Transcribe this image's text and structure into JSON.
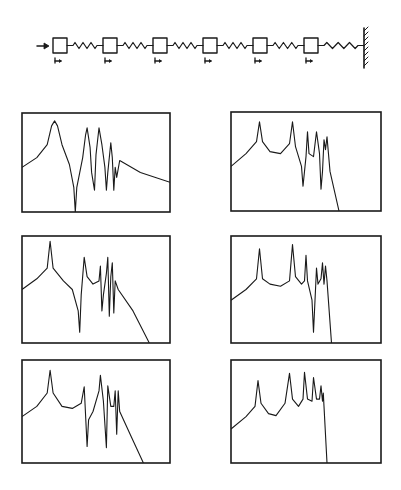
{
  "diagram": {
    "type": "mass-spring chain with frequency response plots",
    "colors": {
      "ink": "#1a1a1a",
      "background": "#ffffff"
    },
    "chain": {
      "input_arrow": {
        "x1": 37,
        "x2": 48,
        "y": 46,
        "icon": "force-arrow-icon"
      },
      "masses": [
        {
          "x": 53,
          "y": 38,
          "w": 14,
          "h": 15
        },
        {
          "x": 103,
          "y": 38,
          "w": 14,
          "h": 15
        },
        {
          "x": 153,
          "y": 38,
          "w": 14,
          "h": 15
        },
        {
          "x": 203,
          "y": 38,
          "w": 14,
          "h": 15
        },
        {
          "x": 253,
          "y": 38,
          "w": 14,
          "h": 15
        },
        {
          "x": 304,
          "y": 38,
          "w": 14,
          "h": 15
        }
      ],
      "springs_count": 6,
      "wall": {
        "x": 364,
        "y1": 28,
        "y2": 68,
        "icon": "fixed-wall-icon"
      },
      "displacement_markers_count": 6
    }
  },
  "chart_data": [
    {
      "type": "line",
      "id": "response-row1-left",
      "title": "",
      "xlabel": "",
      "ylabel": "",
      "grid": false,
      "frame": {
        "x": 22,
        "y": 113,
        "w": 148,
        "h": 99
      },
      "points": [
        [
          0,
          0.55
        ],
        [
          0.1,
          0.45
        ],
        [
          0.17,
          0.32
        ],
        [
          0.2,
          0.13
        ],
        [
          0.22,
          0.08
        ],
        [
          0.24,
          0.13
        ],
        [
          0.27,
          0.32
        ],
        [
          0.32,
          0.52
        ],
        [
          0.35,
          0.75
        ],
        [
          0.36,
          1.0
        ],
        [
          0.37,
          0.75
        ],
        [
          0.41,
          0.45
        ],
        [
          0.43,
          0.22
        ],
        [
          0.44,
          0.15
        ],
        [
          0.46,
          0.35
        ],
        [
          0.47,
          0.6
        ],
        [
          0.49,
          0.78
        ],
        [
          0.5,
          0.42
        ],
        [
          0.52,
          0.15
        ],
        [
          0.54,
          0.32
        ],
        [
          0.56,
          0.55
        ],
        [
          0.57,
          0.78
        ],
        [
          0.58,
          0.6
        ],
        [
          0.6,
          0.3
        ],
        [
          0.61,
          0.45
        ],
        [
          0.62,
          0.78
        ],
        [
          0.63,
          0.55
        ],
        [
          0.64,
          0.65
        ],
        [
          0.66,
          0.48
        ],
        [
          0.8,
          0.6
        ],
        [
          1.0,
          0.7
        ]
      ]
    },
    {
      "type": "line",
      "id": "response-row1-right",
      "title": "",
      "xlabel": "",
      "ylabel": "",
      "grid": false,
      "frame": {
        "x": 231,
        "y": 112,
        "w": 150,
        "h": 99
      },
      "points": [
        [
          0,
          0.55
        ],
        [
          0.1,
          0.42
        ],
        [
          0.17,
          0.3
        ],
        [
          0.19,
          0.1
        ],
        [
          0.21,
          0.3
        ],
        [
          0.26,
          0.4
        ],
        [
          0.33,
          0.42
        ],
        [
          0.39,
          0.32
        ],
        [
          0.41,
          0.1
        ],
        [
          0.43,
          0.35
        ],
        [
          0.47,
          0.55
        ],
        [
          0.48,
          0.75
        ],
        [
          0.5,
          0.45
        ],
        [
          0.51,
          0.2
        ],
        [
          0.52,
          0.42
        ],
        [
          0.55,
          0.45
        ],
        [
          0.57,
          0.2
        ],
        [
          0.59,
          0.42
        ],
        [
          0.6,
          0.78
        ],
        [
          0.61,
          0.6
        ],
        [
          0.62,
          0.28
        ],
        [
          0.63,
          0.38
        ],
        [
          0.64,
          0.25
        ],
        [
          0.66,
          0.6
        ],
        [
          0.72,
          1.0
        ]
      ]
    },
    {
      "type": "line",
      "id": "response-row2-left",
      "title": "",
      "xlabel": "",
      "ylabel": "",
      "grid": false,
      "frame": {
        "x": 22,
        "y": 236,
        "w": 148,
        "h": 107
      },
      "points": [
        [
          0,
          0.5
        ],
        [
          0.1,
          0.4
        ],
        [
          0.17,
          0.3
        ],
        [
          0.19,
          0.05
        ],
        [
          0.21,
          0.3
        ],
        [
          0.28,
          0.42
        ],
        [
          0.34,
          0.5
        ],
        [
          0.38,
          0.7
        ],
        [
          0.39,
          0.9
        ],
        [
          0.4,
          0.55
        ],
        [
          0.42,
          0.2
        ],
        [
          0.44,
          0.38
        ],
        [
          0.48,
          0.45
        ],
        [
          0.52,
          0.42
        ],
        [
          0.53,
          0.28
        ],
        [
          0.54,
          0.7
        ],
        [
          0.55,
          0.55
        ],
        [
          0.57,
          0.35
        ],
        [
          0.58,
          0.2
        ],
        [
          0.59,
          0.75
        ],
        [
          0.6,
          0.38
        ],
        [
          0.61,
          0.25
        ],
        [
          0.62,
          0.72
        ],
        [
          0.63,
          0.42
        ],
        [
          0.65,
          0.5
        ],
        [
          0.75,
          0.7
        ],
        [
          0.86,
          1.0
        ]
      ]
    },
    {
      "type": "line",
      "id": "response-row2-right",
      "title": "",
      "xlabel": "",
      "ylabel": "",
      "grid": false,
      "frame": {
        "x": 231,
        "y": 236,
        "w": 150,
        "h": 107
      },
      "points": [
        [
          0,
          0.6
        ],
        [
          0.1,
          0.5
        ],
        [
          0.17,
          0.4
        ],
        [
          0.19,
          0.12
        ],
        [
          0.21,
          0.4
        ],
        [
          0.26,
          0.45
        ],
        [
          0.33,
          0.47
        ],
        [
          0.39,
          0.42
        ],
        [
          0.41,
          0.08
        ],
        [
          0.43,
          0.38
        ],
        [
          0.47,
          0.45
        ],
        [
          0.49,
          0.42
        ],
        [
          0.5,
          0.18
        ],
        [
          0.51,
          0.42
        ],
        [
          0.54,
          0.6
        ],
        [
          0.55,
          0.9
        ],
        [
          0.56,
          0.6
        ],
        [
          0.57,
          0.3
        ],
        [
          0.58,
          0.45
        ],
        [
          0.6,
          0.4
        ],
        [
          0.61,
          0.25
        ],
        [
          0.62,
          0.45
        ],
        [
          0.63,
          0.28
        ],
        [
          0.64,
          0.42
        ],
        [
          0.67,
          1.0
        ]
      ]
    },
    {
      "type": "line",
      "id": "response-row3-left",
      "title": "",
      "xlabel": "",
      "ylabel": "",
      "grid": false,
      "frame": {
        "x": 22,
        "y": 360,
        "w": 148,
        "h": 103
      },
      "points": [
        [
          0,
          0.55
        ],
        [
          0.1,
          0.45
        ],
        [
          0.17,
          0.32
        ],
        [
          0.19,
          0.1
        ],
        [
          0.21,
          0.32
        ],
        [
          0.27,
          0.45
        ],
        [
          0.34,
          0.47
        ],
        [
          0.4,
          0.42
        ],
        [
          0.42,
          0.26
        ],
        [
          0.44,
          0.84
        ],
        [
          0.45,
          0.58
        ],
        [
          0.48,
          0.5
        ],
        [
          0.52,
          0.3
        ],
        [
          0.53,
          0.15
        ],
        [
          0.55,
          0.4
        ],
        [
          0.57,
          0.85
        ],
        [
          0.58,
          0.25
        ],
        [
          0.6,
          0.45
        ],
        [
          0.62,
          0.45
        ],
        [
          0.63,
          0.3
        ],
        [
          0.64,
          0.72
        ],
        [
          0.65,
          0.3
        ],
        [
          0.66,
          0.5
        ],
        [
          0.74,
          0.75
        ],
        [
          0.82,
          1.0
        ]
      ]
    },
    {
      "type": "line",
      "id": "response-row3-right",
      "title": "",
      "xlabel": "",
      "ylabel": "",
      "grid": false,
      "frame": {
        "x": 231,
        "y": 360,
        "w": 150,
        "h": 103
      },
      "points": [
        [
          0,
          0.67
        ],
        [
          0.1,
          0.55
        ],
        [
          0.16,
          0.45
        ],
        [
          0.18,
          0.2
        ],
        [
          0.2,
          0.42
        ],
        [
          0.25,
          0.52
        ],
        [
          0.3,
          0.54
        ],
        [
          0.36,
          0.42
        ],
        [
          0.39,
          0.13
        ],
        [
          0.41,
          0.38
        ],
        [
          0.45,
          0.45
        ],
        [
          0.48,
          0.38
        ],
        [
          0.49,
          0.12
        ],
        [
          0.51,
          0.38
        ],
        [
          0.54,
          0.4
        ],
        [
          0.55,
          0.17
        ],
        [
          0.57,
          0.38
        ],
        [
          0.59,
          0.38
        ],
        [
          0.6,
          0.25
        ],
        [
          0.61,
          0.4
        ],
        [
          0.615,
          0.32
        ],
        [
          0.62,
          0.45
        ],
        [
          0.64,
          1.0
        ]
      ]
    }
  ]
}
